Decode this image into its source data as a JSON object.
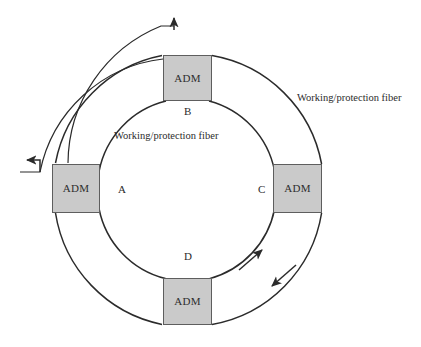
{
  "diagram": {
    "type": "ring-network",
    "colors": {
      "node_fill": "#cacaca",
      "node_stroke": "#5e5e5e",
      "fiber_stroke": "#2b2b2b",
      "background": "#ffffff",
      "text": "#2b2b2b"
    },
    "nodes": [
      {
        "id": "adm-top",
        "label": "ADM",
        "ring_letter": "B",
        "position": "top",
        "x": 163,
        "y": 55,
        "w": 49,
        "h": 46
      },
      {
        "id": "adm-left",
        "label": "ADM",
        "ring_letter": "A",
        "position": "left",
        "x": 52,
        "y": 164,
        "w": 48,
        "h": 49
      },
      {
        "id": "adm-right",
        "label": "ADM",
        "ring_letter": "C",
        "position": "right",
        "x": 273,
        "y": 164,
        "w": 49,
        "h": 49
      },
      {
        "id": "adm-bottom",
        "label": "ADM",
        "ring_letter": "D",
        "position": "bottom",
        "x": 163,
        "y": 278,
        "w": 49,
        "h": 47
      }
    ],
    "ring_letters": [
      {
        "letter": "B",
        "x": 184,
        "y": 106
      },
      {
        "letter": "A",
        "x": 118,
        "y": 184
      },
      {
        "letter": "C",
        "x": 258,
        "y": 184
      },
      {
        "letter": "D",
        "x": 184,
        "y": 251
      }
    ],
    "captions": [
      {
        "id": "outer-fiber-caption",
        "text": "Working/protection fiber",
        "x": 297,
        "y": 93
      },
      {
        "id": "inner-fiber-caption",
        "text": "Working/protection fiber",
        "x": 114,
        "y": 131
      }
    ],
    "geometry": {
      "center_x": 187,
      "center_y": 190,
      "outer_radius": 135,
      "inner_radius": 90,
      "breakout_radius": 148
    },
    "arrows": [
      {
        "id": "inner-ring-direction-arrow",
        "direction": "counterclockwise",
        "x": 258,
        "y": 254
      },
      {
        "id": "outer-ring-direction-arrow",
        "direction": "clockwise",
        "x": 278,
        "y": 281
      },
      {
        "id": "breakout-up-arrow",
        "direction": "up",
        "x": 174,
        "y": 16
      },
      {
        "id": "breakout-left-arrow",
        "direction": "left",
        "x": 22,
        "y": 159
      }
    ]
  }
}
